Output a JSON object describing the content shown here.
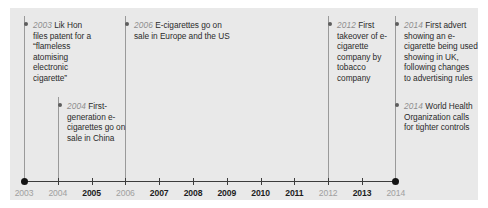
{
  "panel": {
    "background_color": "#e9e9e9",
    "accent_text_color": "#8e8e8e",
    "body_text_color": "#2b2b2b",
    "axis_color": "#3c3c3c"
  },
  "axis": {
    "start_year": 2003,
    "end_year": 2014,
    "years": [
      {
        "label": "2003",
        "has_event": true
      },
      {
        "label": "2004",
        "has_event": true
      },
      {
        "label": "2005",
        "has_event": false
      },
      {
        "label": "2006",
        "has_event": true
      },
      {
        "label": "2007",
        "has_event": false
      },
      {
        "label": "2008",
        "has_event": false
      },
      {
        "label": "2009",
        "has_event": false
      },
      {
        "label": "2010",
        "has_event": false
      },
      {
        "label": "2011",
        "has_event": false
      },
      {
        "label": "2012",
        "has_event": true
      },
      {
        "label": "2013",
        "has_event": false
      },
      {
        "label": "2014",
        "has_event": true
      }
    ]
  },
  "events": [
    {
      "year": "2003",
      "text": "Lik Hon files patent for a “flameless atomising electronic cigarette”"
    },
    {
      "year": "2004",
      "text": "First-generation e-cigarettes go on sale in China"
    },
    {
      "year": "2006",
      "text": "E-cigarettes go on sale in Europe and the US"
    },
    {
      "year": "2012",
      "text": "First takeover of e-cigarette company by tobacco company"
    },
    {
      "year": "2014",
      "text": "First advert showing an e-cigarette being used showing in UK, following changes to advertising rules"
    },
    {
      "year": "2014",
      "text": "World Health Organization calls for tighter controls"
    }
  ]
}
